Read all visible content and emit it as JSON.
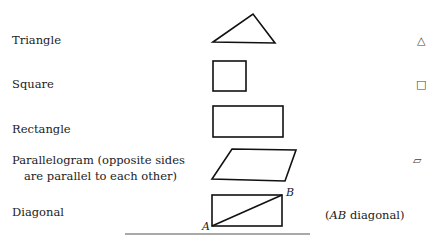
{
  "header": {
    "title_partial": ""
  },
  "rows": [
    {
      "label": "Triangle",
      "symbol": "△",
      "figure": "triangle"
    },
    {
      "label": "Square",
      "symbol": "□",
      "figure": "square"
    },
    {
      "label": "Rectangle",
      "symbol": "",
      "figure": "rectangle"
    },
    {
      "label_line1": "Parallelogram (opposite sides",
      "label_line2": "are parallel to each other)",
      "symbol": "▱",
      "figure": "parallelogram"
    },
    {
      "label": "Diagonal",
      "figure": "diagonal",
      "point_a": "A",
      "point_b": "B",
      "note_italic": "AB",
      "note_rest": " diagonal)",
      "note_open": "("
    }
  ]
}
